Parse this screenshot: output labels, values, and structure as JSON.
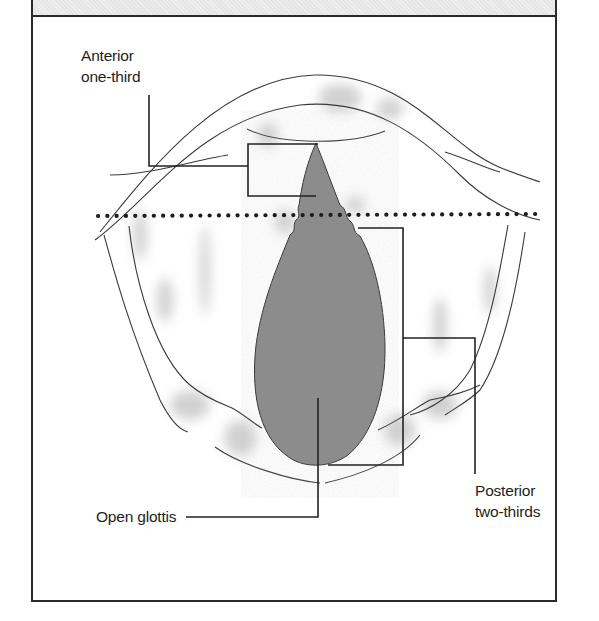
{
  "figure": {
    "colors": {
      "frame": "#2a2a2a",
      "header_fill": "#e6e6e6",
      "glottis_fill": "#8f8f8f",
      "outline": "#3a3a3a",
      "shading": "#bdbdbd",
      "dotted_line": "#1e1e1e"
    },
    "dividing_line": {
      "style": "dotted",
      "meaning": "boundary between anterior one-third and posterior two-thirds"
    }
  },
  "labels": {
    "anterior": {
      "line1": "Anterior",
      "line2": "one-third"
    },
    "posterior": {
      "line1": "Posterior",
      "line2": "two-thirds"
    },
    "glottis": {
      "text": "Open glottis"
    }
  }
}
